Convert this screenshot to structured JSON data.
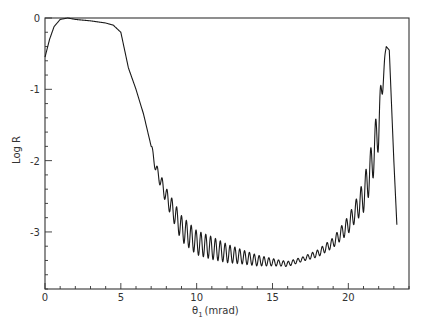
{
  "chart_data": {
    "type": "line",
    "title": "",
    "xlabel": "θ1 (mrad)",
    "ylabel": "Log R",
    "xlim": [
      0,
      24
    ],
    "ylim": [
      -3.8,
      0
    ],
    "xticks_major": [
      0,
      5,
      10,
      15,
      20
    ],
    "xtick_labels": [
      "0",
      "5",
      "10",
      "15",
      "20"
    ],
    "yticks_major": [
      0,
      -1,
      -2,
      -3
    ],
    "ytick_labels": [
      "0",
      "-1",
      "-2",
      "-3"
    ],
    "grid": false,
    "legend": null,
    "series": [
      {
        "name": "reflectivity",
        "description": "Log reflectivity vs incidence angle; plateau near 0 below ~5 mrad, steep drop, interference oscillations from ~7 to ~22 mrad, sharp peak near 22.5 mrad",
        "x": [
          0,
          0.3,
          0.6,
          1.0,
          1.5,
          2.0,
          3.0,
          4.0,
          4.5,
          5.0,
          5.2,
          5.5,
          6.0,
          6.5,
          7.0,
          7.3,
          8.0,
          9.0,
          10.0,
          12.0,
          14.0,
          16.0,
          17.0,
          18.0,
          19.0,
          20.0,
          21.0,
          21.5,
          22.0,
          22.3,
          22.5,
          22.7,
          23.0,
          23.2
        ],
        "values": [
          -0.55,
          -0.3,
          -0.12,
          -0.02,
          0.0,
          -0.02,
          -0.04,
          -0.07,
          -0.1,
          -0.2,
          -0.4,
          -0.7,
          -1.0,
          -1.35,
          -1.8,
          -2.1,
          -2.5,
          -2.95,
          -3.15,
          -3.3,
          -3.4,
          -3.45,
          -3.38,
          -3.3,
          -3.15,
          -2.9,
          -2.5,
          -2.1,
          -1.5,
          -0.8,
          -0.4,
          -0.45,
          -2.0,
          -2.9
        ]
      }
    ],
    "oscillation": {
      "start_mrad": 7.0,
      "end_mrad": 22.5,
      "period_mrad": 0.32,
      "amplitude_profile": [
        [
          7.0,
          0.05
        ],
        [
          9.0,
          0.18
        ],
        [
          11.0,
          0.16
        ],
        [
          13.0,
          0.1
        ],
        [
          15.5,
          0.04
        ],
        [
          17.0,
          0.03
        ],
        [
          19.0,
          0.07
        ],
        [
          20.5,
          0.15
        ],
        [
          21.5,
          0.3
        ],
        [
          22.2,
          0.35
        ]
      ]
    }
  },
  "axes": {
    "x_label_theta": "θ",
    "x_label_sub": "1",
    "x_label_unit": "(mrad)",
    "y_label": "Log R"
  }
}
